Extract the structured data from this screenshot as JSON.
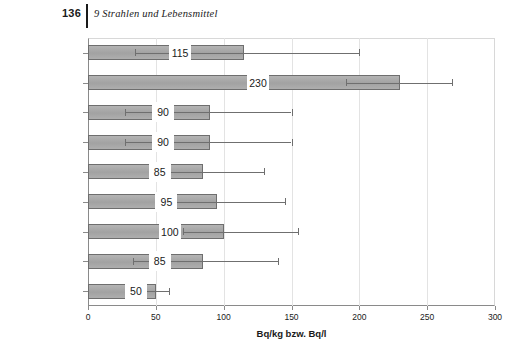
{
  "header": {
    "page_number": "136",
    "chapter_title": "9  Strahlen und Lebensmittel"
  },
  "chart_data": {
    "type": "bar",
    "orientation": "horizontal",
    "title": "",
    "xlabel": "Bq/kg bzw. Bq/l",
    "ylabel": "",
    "xlim": [
      0,
      300
    ],
    "xticks": [
      "0",
      "50",
      "100",
      "150",
      "200",
      "250",
      "300"
    ],
    "xtick_values": [
      0,
      50,
      100,
      150,
      200,
      250,
      300
    ],
    "grid": "vertical",
    "legend": "none",
    "categories": [
      "Honig",
      "Haselnüsse",
      "Obst",
      "Gemüse",
      "Geflügel",
      "Kalbfleisch",
      "Rindfleisch",
      "Schweinefleisch",
      "Milch"
    ],
    "values": [
      115,
      230,
      90,
      90,
      85,
      95,
      100,
      85,
      50
    ],
    "value_labels": [
      "115",
      "230",
      "90",
      "90",
      "85",
      "95",
      "100",
      "85",
      "50"
    ],
    "error_low": [
      35,
      190,
      27,
      27,
      55,
      62,
      70,
      33,
      42
    ],
    "error_high": [
      200,
      268,
      150,
      150,
      130,
      145,
      155,
      140,
      60
    ],
    "bar_color": "#a9a9a9",
    "bar_border_color": "#6e6e6e",
    "error_color": "#6f6f6f",
    "grid_color": "#e3e3e3",
    "axis_color": "#8a8a8a"
  }
}
